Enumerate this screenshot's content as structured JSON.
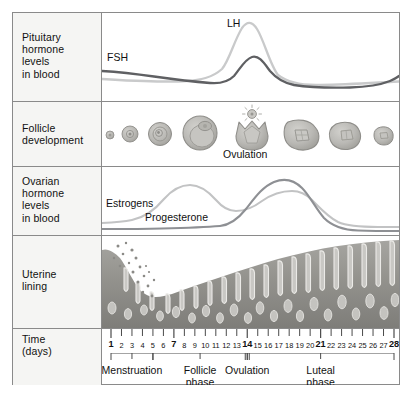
{
  "diagram": {
    "rows": [
      {
        "id": "pituitary",
        "label": "Pituitary\nhormone\nlevels\nin blood"
      },
      {
        "id": "follicle",
        "label": "Follicle\ndevelopment"
      },
      {
        "id": "ovarian",
        "label": "Ovarian\nhormone\nlevels\nin blood"
      },
      {
        "id": "uterine",
        "label": "Uterine\nlining"
      },
      {
        "id": "time",
        "label": "Time\n(days)"
      }
    ],
    "row_labels": {
      "pituitary_l1": "Pituitary",
      "pituitary_l2": "hormone",
      "pituitary_l3": "levels",
      "pituitary_l4": "in blood",
      "follicle_l1": "Follicle",
      "follicle_l2": "development",
      "ovarian_l1": "Ovarian",
      "ovarian_l2": "hormone",
      "ovarian_l3": "levels",
      "ovarian_l4": "in blood",
      "uterine_l1": "Uterine",
      "uterine_l2": "lining",
      "time_l1": "Time",
      "time_l2": "(days)"
    },
    "curve_labels": {
      "fsh": "FSH",
      "lh": "LH",
      "estrogens": "Estrogens",
      "progesterone": "Progesterone",
      "ovulation": "Ovulation"
    },
    "phases": [
      {
        "name": "Menstruation",
        "line1": "Menstruation",
        "line2": "",
        "start_day": 1,
        "end_day": 5
      },
      {
        "name": "Follicle phase",
        "line1": "Follicle",
        "line2": "phase",
        "start_day": 5,
        "end_day": 14
      },
      {
        "name": "Ovulation",
        "line1": "Ovulation",
        "line2": "",
        "start_day": 14,
        "end_day": 14
      },
      {
        "name": "Luteal phase",
        "line1": "Luteal",
        "line2": "phase",
        "start_day": 14,
        "end_day": 28
      }
    ],
    "days": [
      1,
      2,
      3,
      4,
      5,
      6,
      7,
      8,
      9,
      10,
      11,
      12,
      13,
      14,
      15,
      16,
      17,
      18,
      19,
      20,
      21,
      22,
      23,
      24,
      25,
      26,
      27,
      28
    ],
    "bold_days": [
      1,
      7,
      14,
      21,
      28
    ],
    "colors": {
      "border": "#8a8a8a",
      "label_panel": "#f5f5f3",
      "fsh_line": "#5f6063",
      "lh_line": "#c9cacb",
      "estrogen_line": "#c2c3c4",
      "progesterone_line": "#8e9094",
      "follicle_fill": "#b9b8b4",
      "follicle_edge": "#8e8d89",
      "endometrium": "#9b9a96",
      "axis_bar": "#7c7c7c",
      "text": "#111111"
    }
  },
  "chart_data": [
    {
      "type": "line",
      "title": "Pituitary hormone levels in blood",
      "xlabel": "Time (days)",
      "ylabel": "Hormone level",
      "xlim": [
        1,
        28
      ],
      "grid": false,
      "legend": [
        "FSH",
        "LH"
      ],
      "x": [
        1,
        3,
        5,
        7,
        9,
        11,
        12,
        13,
        13.5,
        14,
        14.5,
        15,
        16,
        17,
        19,
        21,
        23,
        25,
        27,
        28
      ],
      "series": [
        {
          "name": "FSH",
          "color": "#5f6063",
          "values": [
            0.62,
            0.58,
            0.52,
            0.46,
            0.4,
            0.36,
            0.4,
            0.58,
            0.72,
            0.78,
            0.7,
            0.5,
            0.33,
            0.28,
            0.26,
            0.26,
            0.27,
            0.28,
            0.3,
            0.34
          ]
        },
        {
          "name": "LH",
          "color": "#c9cacb",
          "values": [
            0.3,
            0.28,
            0.26,
            0.25,
            0.24,
            0.26,
            0.4,
            0.8,
            0.96,
            1.0,
            0.9,
            0.58,
            0.32,
            0.24,
            0.2,
            0.19,
            0.19,
            0.2,
            0.21,
            0.22
          ]
        }
      ]
    },
    {
      "type": "line",
      "title": "Ovarian hormone levels in blood",
      "xlabel": "Time (days)",
      "ylabel": "Hormone level",
      "xlim": [
        1,
        28
      ],
      "grid": false,
      "legend": [
        "Estrogens",
        "Progesterone"
      ],
      "x": [
        1,
        3,
        5,
        7,
        9,
        11,
        12,
        13,
        14,
        15,
        16,
        17,
        18,
        19,
        20,
        21,
        22,
        23,
        24,
        25,
        26,
        27,
        28
      ],
      "series": [
        {
          "name": "Estrogens",
          "color": "#c2c3c4",
          "values": [
            0.16,
            0.17,
            0.2,
            0.26,
            0.4,
            0.66,
            0.76,
            0.74,
            0.62,
            0.48,
            0.42,
            0.44,
            0.5,
            0.56,
            0.6,
            0.6,
            0.56,
            0.48,
            0.34,
            0.18,
            0.12,
            0.11,
            0.11
          ]
        },
        {
          "name": "Progesterone",
          "color": "#8e9094",
          "values": [
            0.08,
            0.08,
            0.08,
            0.08,
            0.08,
            0.09,
            0.1,
            0.11,
            0.14,
            0.28,
            0.48,
            0.66,
            0.8,
            0.88,
            0.9,
            0.88,
            0.8,
            0.66,
            0.46,
            0.24,
            0.14,
            0.13,
            0.13
          ]
        }
      ]
    },
    {
      "type": "area",
      "title": "Uterine lining thickness",
      "xlabel": "Time (days)",
      "ylabel": "Endometrial thickness",
      "xlim": [
        1,
        28
      ],
      "grid": false,
      "x": [
        1,
        2,
        3,
        4,
        5,
        6,
        7,
        8,
        9,
        10,
        11,
        12,
        13,
        14,
        15,
        16,
        17,
        18,
        19,
        20,
        21,
        22,
        23,
        24,
        25,
        26,
        27,
        28
      ],
      "values": [
        0.62,
        0.52,
        0.4,
        0.28,
        0.2,
        0.18,
        0.2,
        0.24,
        0.28,
        0.33,
        0.38,
        0.43,
        0.48,
        0.53,
        0.58,
        0.63,
        0.68,
        0.72,
        0.76,
        0.8,
        0.83,
        0.86,
        0.88,
        0.9,
        0.92,
        0.93,
        0.94,
        0.95
      ]
    },
    {
      "type": "scatter",
      "title": "Follicle development stages",
      "xlabel": "Time (days)",
      "ylabel": "Follicle size",
      "xlim": [
        1,
        28
      ],
      "grid": false,
      "stages": [
        {
          "day": 2,
          "label": "primordial follicle",
          "size": 4
        },
        {
          "day": 5,
          "label": "primary follicle",
          "size": 8
        },
        {
          "day": 9,
          "label": "secondary follicle",
          "size": 12
        },
        {
          "day": 12,
          "label": "mature Graafian follicle",
          "size": 18
        },
        {
          "day": 14,
          "label": "ovulation",
          "size": 16
        },
        {
          "day": 18,
          "label": "corpus luteum",
          "size": 15
        },
        {
          "day": 22,
          "label": "regressing corpus luteum",
          "size": 13
        },
        {
          "day": 26,
          "label": "corpus albicans",
          "size": 9
        }
      ]
    }
  ]
}
